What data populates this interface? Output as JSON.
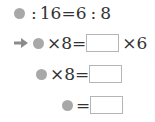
{
  "problem": {
    "row1": {
      "colon1": ":",
      "a": "16",
      "eq": "=",
      "b": "6",
      "colon2": ":",
      "c": "8"
    },
    "row2": {
      "times": "×",
      "n": "8",
      "eq": "=",
      "times2": "×",
      "m": "6"
    },
    "row3": {
      "times": "×",
      "n": "8",
      "eq": "="
    },
    "row4": {
      "eq": "="
    }
  },
  "colors": {
    "dot": "#a8a8a8",
    "arrow": "#8c8c8c",
    "box_border": "#b5b5b5",
    "text": "#333333"
  }
}
